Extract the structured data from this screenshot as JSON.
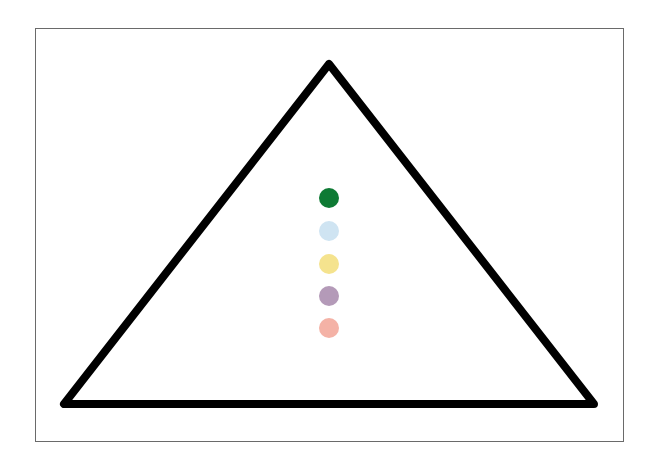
{
  "diagram": {
    "type": "triangle-with-dots",
    "frame": {
      "border_color": "#6a6a6a"
    },
    "triangle": {
      "stroke_color": "#000000",
      "stroke_width": 8,
      "vertices": [
        [
          329,
          64
        ],
        [
          64,
          404
        ],
        [
          594,
          404
        ]
      ]
    },
    "dots": [
      {
        "label": "dark-green-dot",
        "color": "#0e7a34",
        "cx": 329,
        "cy": 198
      },
      {
        "label": "light-blue-dot",
        "color": "#cfe4f2",
        "cx": 329,
        "cy": 231
      },
      {
        "label": "yellow-dot",
        "color": "#f5e38e",
        "cx": 329,
        "cy": 264
      },
      {
        "label": "mauve-dot",
        "color": "#b49ab8",
        "cx": 329,
        "cy": 296
      },
      {
        "label": "salmon-dot",
        "color": "#f4b2a6",
        "cx": 329,
        "cy": 328
      }
    ],
    "dot_radius": 10
  }
}
